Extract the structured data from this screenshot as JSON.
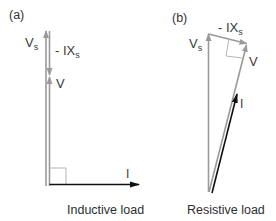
{
  "figure": {
    "panels": [
      {
        "id": "a",
        "label": "(a)",
        "caption": "Inductive load",
        "vectors": {
          "Vs": {
            "symbol": "V",
            "subscript": "s",
            "color": "#9a9a9a"
          },
          "IXs": {
            "prefix": "- IX",
            "subscript": "s",
            "color": "#9a9a9a"
          },
          "V": {
            "symbol": "V",
            "color": "#9a9a9a"
          },
          "I": {
            "symbol": "I",
            "color": "#111111"
          }
        }
      },
      {
        "id": "b",
        "label": "(b)",
        "caption": "Resistive load",
        "vectors": {
          "Vs": {
            "symbol": "V",
            "subscript": "s",
            "color": "#9a9a9a"
          },
          "IXs": {
            "prefix": "- IX",
            "subscript": "s",
            "color": "#9a9a9a"
          },
          "V": {
            "symbol": "V",
            "color": "#9a9a9a"
          },
          "I": {
            "symbol": "I",
            "color": "#111111"
          }
        }
      }
    ]
  }
}
